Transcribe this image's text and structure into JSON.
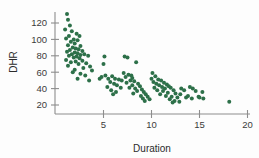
{
  "chart_data": {
    "type": "scatter",
    "title": "",
    "xlabel": "Duration",
    "ylabel": "DHR",
    "xlim": [
      0,
      20.6
    ],
    "ylim": [
      10,
      132
    ],
    "xticks": [
      5,
      10,
      15,
      20
    ],
    "yticks": [
      20,
      40,
      60,
      80,
      100,
      120
    ],
    "grid": false,
    "legend": "none",
    "marker_color": "#2d7049",
    "marker_size": 2.0,
    "axis_color": "#8d8d8d",
    "text_color": "#3b3b3b",
    "background_color": "#fdfdfd",
    "points": [
      [
        1.2,
        131
      ],
      [
        1.3,
        124
      ],
      [
        1.5,
        117
      ],
      [
        1.0,
        112
      ],
      [
        1.7,
        110
      ],
      [
        2.2,
        107
      ],
      [
        1.4,
        104
      ],
      [
        2.5,
        104
      ],
      [
        1.1,
        101
      ],
      [
        1.9,
        100
      ],
      [
        2.3,
        99
      ],
      [
        1.6,
        97
      ],
      [
        2.0,
        95
      ],
      [
        1.3,
        93
      ],
      [
        2.6,
        92
      ],
      [
        1.8,
        90
      ],
      [
        2.1,
        89
      ],
      [
        2.4,
        88
      ],
      [
        1.5,
        87
      ],
      [
        2.8,
        86
      ],
      [
        1.2,
        85
      ],
      [
        2.0,
        84
      ],
      [
        2.3,
        83
      ],
      [
        1.7,
        82
      ],
      [
        3.0,
        82
      ],
      [
        2.6,
        81
      ],
      [
        1.4,
        80
      ],
      [
        2.2,
        79
      ],
      [
        1.9,
        78
      ],
      [
        2.5,
        77
      ],
      [
        3.4,
        80
      ],
      [
        1.1,
        75
      ],
      [
        2.8,
        74
      ],
      [
        2.1,
        73
      ],
      [
        1.6,
        72
      ],
      [
        3.2,
        71
      ],
      [
        2.4,
        70
      ],
      [
        1.3,
        68
      ],
      [
        3.6,
        67
      ],
      [
        2.9,
        65
      ],
      [
        2.0,
        63
      ],
      [
        3.8,
        62
      ],
      [
        1.8,
        60
      ],
      [
        2.6,
        58
      ],
      [
        3.1,
        56
      ],
      [
        2.3,
        52
      ],
      [
        3.5,
        50
      ],
      [
        4.6,
        52
      ],
      [
        5.1,
        79
      ],
      [
        5.0,
        70
      ],
      [
        5.2,
        56
      ],
      [
        4.8,
        54
      ],
      [
        5.5,
        52
      ],
      [
        5.9,
        55
      ],
      [
        6.2,
        52
      ],
      [
        6.6,
        51
      ],
      [
        6.9,
        50
      ],
      [
        5.7,
        48
      ],
      [
        6.1,
        46
      ],
      [
        6.4,
        44
      ],
      [
        5.4,
        42
      ],
      [
        6.8,
        41
      ],
      [
        5.8,
        38
      ],
      [
        6.3,
        36
      ],
      [
        6.0,
        33
      ],
      [
        7.2,
        79
      ],
      [
        7.5,
        78
      ],
      [
        7.1,
        59
      ],
      [
        7.6,
        57
      ],
      [
        7.9,
        56
      ],
      [
        7.3,
        54
      ],
      [
        8.0,
        53
      ],
      [
        8.4,
        72
      ],
      [
        7.8,
        50
      ],
      [
        8.2,
        49
      ],
      [
        7.4,
        47
      ],
      [
        8.6,
        46
      ],
      [
        8.0,
        44
      ],
      [
        8.8,
        43
      ],
      [
        7.7,
        41
      ],
      [
        8.3,
        40
      ],
      [
        9.0,
        39
      ],
      [
        8.5,
        37
      ],
      [
        9.2,
        36
      ],
      [
        8.1,
        34
      ],
      [
        9.4,
        33
      ],
      [
        8.9,
        31
      ],
      [
        9.6,
        30
      ],
      [
        9.1,
        28
      ],
      [
        9.8,
        27
      ],
      [
        9.3,
        25
      ],
      [
        10.1,
        59
      ],
      [
        10.4,
        55
      ],
      [
        10.0,
        52
      ],
      [
        10.7,
        51
      ],
      [
        10.2,
        48
      ],
      [
        11.0,
        50
      ],
      [
        10.5,
        46
      ],
      [
        11.3,
        47
      ],
      [
        10.8,
        44
      ],
      [
        11.6,
        45
      ],
      [
        11.1,
        42
      ],
      [
        10.3,
        41
      ],
      [
        11.8,
        43
      ],
      [
        11.4,
        40
      ],
      [
        10.6,
        38
      ],
      [
        12.0,
        41
      ],
      [
        11.2,
        37
      ],
      [
        12.3,
        38
      ],
      [
        11.7,
        35
      ],
      [
        10.9,
        33
      ],
      [
        12.5,
        34
      ],
      [
        11.5,
        31
      ],
      [
        12.1,
        30
      ],
      [
        12.7,
        29
      ],
      [
        11.9,
        27
      ],
      [
        12.4,
        25
      ],
      [
        12.9,
        24
      ],
      [
        12.2,
        23
      ],
      [
        13.1,
        40
      ],
      [
        13.4,
        38
      ],
      [
        13.0,
        33
      ],
      [
        13.6,
        29
      ],
      [
        14.0,
        42
      ],
      [
        14.3,
        40
      ],
      [
        13.8,
        31
      ],
      [
        14.6,
        37
      ],
      [
        14.2,
        28
      ],
      [
        14.9,
        30
      ],
      [
        15.3,
        36
      ],
      [
        15.0,
        29
      ],
      [
        15.4,
        28
      ],
      [
        18.1,
        24
      ]
    ]
  }
}
